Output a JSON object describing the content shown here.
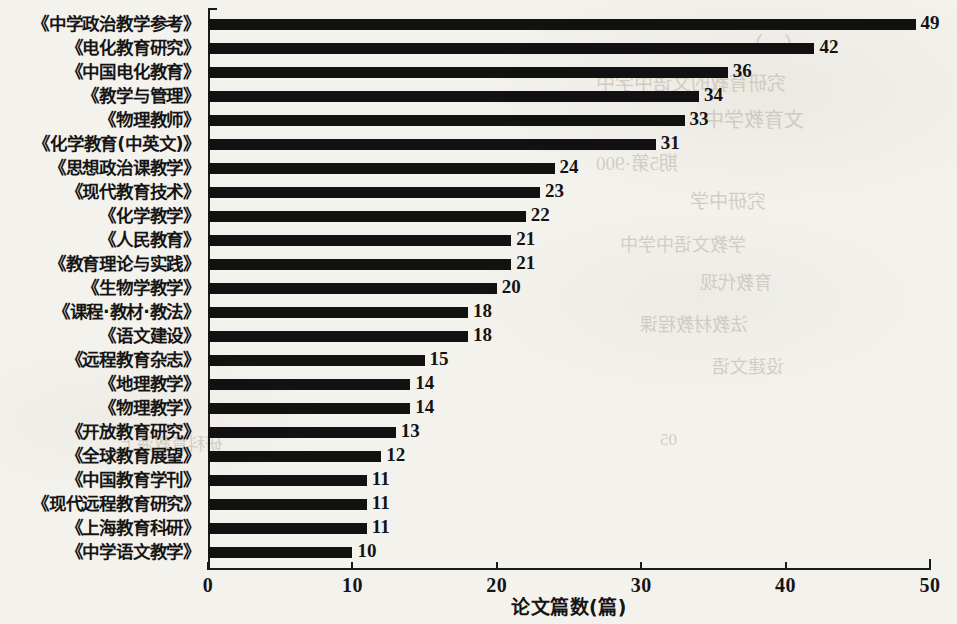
{
  "chart_data": {
    "type": "bar",
    "orientation": "horizontal",
    "title": "",
    "xlabel": "论文篇数(篇)",
    "ylabel": "",
    "xlim": [
      0,
      50
    ],
    "xticks": [
      0,
      10,
      20,
      30,
      40,
      50
    ],
    "grid": false,
    "legend": false,
    "bar_color": "#111111",
    "background_color": "#f4f2ed",
    "categories": [
      "《中学政治教学参考》",
      "《电化教育研究》",
      "《中国电化教育》",
      "《教学与管理》",
      "《物理教师》",
      "《化学教育(中英文)》",
      "《思想政治课教学》",
      "《现代教育技术》",
      "《化学教学》",
      "《人民教育》",
      "《教育理论与实践》",
      "《生物学教学》",
      "《课程·教材·教法》",
      "《语文建设》",
      "《远程教育杂志》",
      "《地理教学》",
      "《物理教学》",
      "《开放教育研究》",
      "《全球教育展望》",
      "《中国教育学刊》",
      "《现代远程教育研究》",
      "《上海教育科研》",
      "《中学语文教学》"
    ],
    "values": [
      49,
      42,
      36,
      34,
      33,
      31,
      24,
      23,
      22,
      21,
      21,
      20,
      18,
      18,
      15,
      14,
      14,
      13,
      12,
      11,
      11,
      11,
      10
    ]
  },
  "bleed_through": [
    {
      "text": "（一）",
      "x": 742,
      "y": 28,
      "size": 21
    },
    {
      "text": "究研育教的文语中学中",
      "x": 596,
      "y": 68,
      "size": 19
    },
    {
      "text": "文育教学中",
      "x": 704,
      "y": 104,
      "size": 20
    },
    {
      "text": "期5第·900",
      "x": 596,
      "y": 148,
      "size": 19
    },
    {
      "text": "究研中学",
      "x": 690,
      "y": 186,
      "size": 19
    },
    {
      "text": "学教文语中学中",
      "x": 620,
      "y": 230,
      "size": 18
    },
    {
      "text": "育教代现",
      "x": 700,
      "y": 268,
      "size": 18
    },
    {
      "text": "法教材教程课",
      "x": 640,
      "y": 310,
      "size": 18
    },
    {
      "text": "设建文语",
      "x": 712,
      "y": 352,
      "size": 18
    },
    {
      "text": "05",
      "x": 660,
      "y": 430,
      "size": 17
    },
    {
      "text": "研科育教海上",
      "x": 120,
      "y": 430,
      "size": 17
    }
  ]
}
